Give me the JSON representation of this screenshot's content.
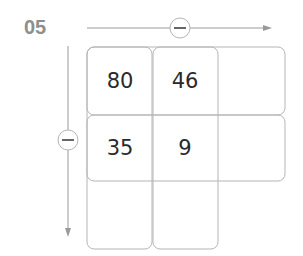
{
  "problem_number": "05",
  "operations": {
    "horizontal": {
      "symbol": "minus",
      "direction": "right"
    },
    "vertical": {
      "symbol": "minus",
      "direction": "down"
    }
  },
  "grid": {
    "rows": [
      [
        "80",
        "46",
        ""
      ],
      [
        "35",
        "9",
        ""
      ],
      [
        "",
        "",
        ""
      ]
    ]
  },
  "colors": {
    "label": "#8e8e8e",
    "lines": "#b5b5b5",
    "arrow": "#9a9a9a",
    "text": "#2a2a2a"
  }
}
